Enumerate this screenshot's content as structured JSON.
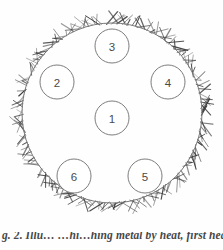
{
  "figure": {
    "kind": "hatched-circle-diagram",
    "rim": {
      "center_x": 112,
      "center_y": 113,
      "radius": 90,
      "hatch_tick_count": 210,
      "hatch_inner_offset": 0,
      "hatch_outer_length_min": 4,
      "hatch_outer_length_max": 13,
      "outline_color": "#7a7a7a",
      "hatch_color": "#3b3b3b"
    },
    "callouts": [
      {
        "label": "1",
        "x": 112,
        "y": 118,
        "r": 17
      },
      {
        "label": "2",
        "x": 57,
        "y": 82,
        "r": 17
      },
      {
        "label": "3",
        "x": 112,
        "y": 46,
        "r": 17
      },
      {
        "label": "4",
        "x": 168,
        "y": 82,
        "r": 17
      },
      {
        "label": "5",
        "x": 145,
        "y": 176,
        "r": 17
      },
      {
        "label": "6",
        "x": 74,
        "y": 176,
        "r": 17
      }
    ]
  },
  "caption": {
    "text": "g. 2. Illu… …hi…hing metal by heat, first heat a",
    "clipped": true
  },
  "colors": {
    "page_background": "#fefefe",
    "ink": "#3b3b3b",
    "outline": "#7a7a7a",
    "label_ink": "#4a4a4a"
  }
}
